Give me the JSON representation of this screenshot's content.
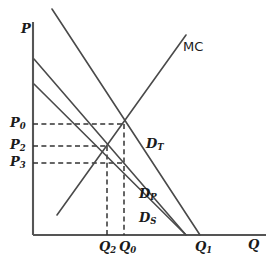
{
  "figure": {
    "type": "economics-diagram",
    "axes": {
      "y_label": "P",
      "x_label": "Q",
      "origin": {
        "x": 33,
        "y": 235
      },
      "y_top": 22,
      "x_right": 266,
      "color": "#555555"
    },
    "price_ticks": [
      {
        "id": "P0",
        "base": "P",
        "sub": "0",
        "y": 124,
        "x_text": 10,
        "y_text": 117
      },
      {
        "id": "P2",
        "base": "P",
        "sub": "2",
        "y": 146,
        "x_text": 10,
        "y_text": 139
      },
      {
        "id": "P3",
        "base": "P",
        "sub": "3",
        "y": 163,
        "x_text": 10,
        "y_text": 156
      }
    ],
    "quantity_ticks": [
      {
        "id": "Q2",
        "base": "Q",
        "sub": "2",
        "x": 107,
        "x_text": 99,
        "y_text": 243
      },
      {
        "id": "Q0",
        "base": "Q",
        "sub": "0",
        "x": 124,
        "x_text": 118,
        "y_text": 243
      },
      {
        "id": "Q1",
        "base": "Q",
        "sub": "1",
        "x": 200,
        "x_text": 196,
        "y_text": 243
      }
    ],
    "curves": [
      {
        "id": "DT",
        "label_base": "D",
        "label_sub": "T",
        "label_x": 146,
        "label_y": 138,
        "x1": 52,
        "y1": 9,
        "x2": 200,
        "y2": 235
      },
      {
        "id": "DP",
        "label_base": "D",
        "label_sub": "P",
        "label_x": 139,
        "label_y": 188,
        "x1": 34,
        "y1": 59,
        "x2": 186,
        "y2": 235
      },
      {
        "id": "DS",
        "label_base": "D",
        "label_sub": "S",
        "label_x": 139,
        "label_y": 212,
        "x1": 34,
        "y1": 84,
        "x2": 186,
        "y2": 235
      },
      {
        "id": "MC",
        "label_base": "MC",
        "label_sub": "",
        "label_x": 183,
        "label_y": 40,
        "x1": 57,
        "y1": 215,
        "x2": 186,
        "y2": 35
      }
    ],
    "guides": [
      {
        "id": "guide-P0",
        "orient": "h",
        "from_x": 33,
        "to_x": 124,
        "y": 124
      },
      {
        "id": "guide-P2",
        "orient": "h",
        "from_x": 33,
        "to_x": 107,
        "y": 146
      },
      {
        "id": "guide-P3",
        "orient": "h",
        "from_x": 33,
        "to_x": 124,
        "y": 163
      },
      {
        "id": "guide-Q0",
        "orient": "v",
        "x": 124,
        "from_y": 124,
        "to_y": 235
      },
      {
        "id": "guide-Q2",
        "orient": "v",
        "x": 107,
        "from_y": 146,
        "to_y": 235
      }
    ],
    "intersections": [
      {
        "id": "eq-P0-Q0",
        "x": 124,
        "y": 124
      },
      {
        "id": "eq-P2-Q2",
        "x": 107,
        "y": 146
      }
    ],
    "colors": {
      "line": "#4a4a4a",
      "axis": "#555555",
      "dashed": "#333333",
      "text": "#1a1a1a",
      "background": "#ffffff"
    }
  },
  "chart_data": {
    "type": "line",
    "title": "",
    "xlabel": "Q",
    "ylabel": "P",
    "grid": false,
    "legend": "inline-annotations",
    "xlim": [
      0,
      240
    ],
    "ylim": [
      0,
      215
    ],
    "series": [
      {
        "name": "D_T",
        "points": [
          [
            18,
            232
          ],
          [
            168,
            0
          ]
        ],
        "note": "total demand, steepest downward slope"
      },
      {
        "name": "D_P",
        "points": [
          [
            0,
            178
          ],
          [
            154,
            0
          ]
        ],
        "note": "private demand"
      },
      {
        "name": "D_S",
        "points": [
          [
            0,
            153
          ],
          [
            154,
            0
          ]
        ],
        "note": "social/spillover demand"
      },
      {
        "name": "MC",
        "points": [
          [
            25,
            21
          ],
          [
            154,
            202
          ]
        ],
        "note": "marginal cost, upward sloping"
      }
    ],
    "annotations": [
      {
        "text": "P0",
        "type": "price-level",
        "value": 112
      },
      {
        "text": "P2",
        "type": "price-level",
        "value": 90
      },
      {
        "text": "P3",
        "type": "price-level",
        "value": 73
      },
      {
        "text": "Q2",
        "type": "quantity-level",
        "value": 74
      },
      {
        "text": "Q0",
        "type": "quantity-level",
        "value": 91
      },
      {
        "text": "Q1",
        "type": "quantity-level",
        "value": 167
      }
    ]
  }
}
